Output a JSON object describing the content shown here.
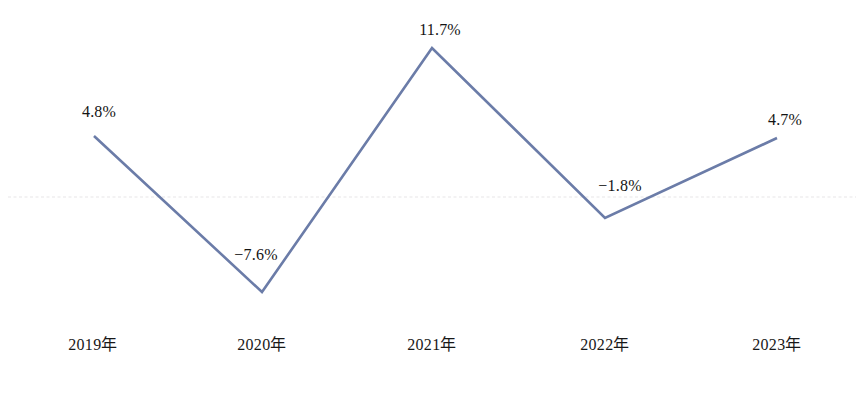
{
  "chart_data": {
    "type": "line",
    "title": "",
    "subtitle": "",
    "xlabel": "",
    "ylabel": "",
    "categories": [
      "2019年",
      "2020年",
      "2021年",
      "2022年",
      "2023年"
    ],
    "values": [
      4.8,
      -7.6,
      11.7,
      -1.8,
      4.7
    ],
    "value_labels": [
      "4.8%",
      "−7.6%",
      "11.7%",
      "−1.8%",
      "4.7%"
    ],
    "series": [
      {
        "name": "",
        "values": [
          4.8,
          -7.6,
          11.7,
          -1.8,
          4.7
        ]
      }
    ],
    "ylim": [
      -9.5,
      13.5
    ],
    "grid": true,
    "gridlines": [
      0
    ],
    "legend": "none",
    "markers": "none",
    "colors": {
      "line": "#6b7ca8",
      "gridline": "#e8e6e8",
      "label_text": "#141414",
      "axis_text": "#181818",
      "background": "#ffffff"
    }
  },
  "points": [
    {
      "label": "2019年",
      "value_label": "4.8%",
      "x": 94,
      "y": 136,
      "tick_x": 93,
      "lx": 99,
      "ly": 112
    },
    {
      "label": "2020年",
      "value_label": "−7.6%",
      "x": 262,
      "y": 292,
      "tick_x": 262,
      "lx": 256,
      "ly": 255
    },
    {
      "label": "2021年",
      "value_label": "11.7%",
      "x": 432,
      "y": 48,
      "tick_x": 432,
      "lx": 440,
      "ly": 30
    },
    {
      "label": "2022年",
      "value_label": "−1.8%",
      "x": 605,
      "y": 218,
      "tick_x": 605,
      "lx": 620,
      "ly": 186
    },
    {
      "label": "2023年",
      "value_label": "4.7%",
      "x": 777,
      "y": 138,
      "tick_x": 777,
      "lx": 785,
      "ly": 120
    }
  ],
  "axis": {
    "tick_label_y": 345,
    "zero_line_y": 197
  }
}
